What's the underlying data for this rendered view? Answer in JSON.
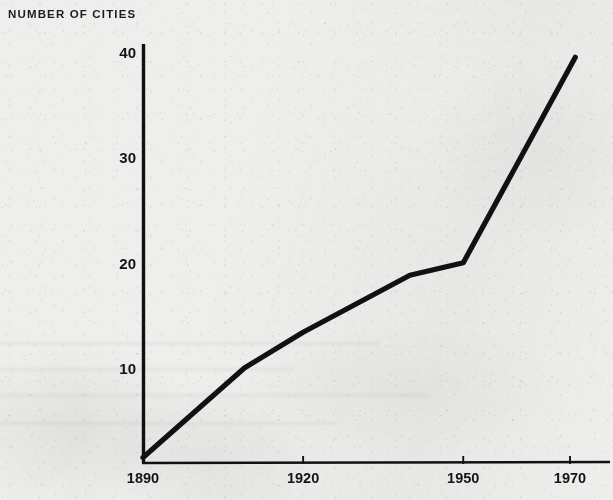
{
  "figure": {
    "axis_title": "NUMBER OF CITIES",
    "background_color": "#eeeeec",
    "ink_color": "#111111"
  },
  "chart_data": {
    "type": "line",
    "title": "",
    "ylabel": "NUMBER OF CITIES",
    "xlabel": "",
    "grid": false,
    "legend": null,
    "xlim": [
      1890,
      1975
    ],
    "ylim": [
      0,
      42
    ],
    "x_ticks": [
      1890,
      1920,
      1950,
      1970
    ],
    "x_tick_labels": [
      "1890",
      "1920",
      "1950",
      "1970"
    ],
    "y_ticks": [
      10,
      20,
      30,
      40
    ],
    "y_tick_labels": [
      "10",
      "20",
      "30",
      "40"
    ],
    "series": [
      {
        "name": "Number of cities",
        "x": [
          1890,
          1909,
          1920,
          1940,
          1950,
          1971
        ],
        "values": [
          1.5,
          10.0,
          13.4,
          18.8,
          20.0,
          39.5
        ]
      }
    ]
  }
}
